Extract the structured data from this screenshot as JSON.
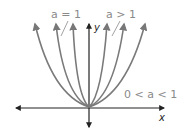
{
  "diagram": {
    "type": "parabola-family",
    "axes": {
      "x_label": "x",
      "y_label": "y"
    },
    "labels": {
      "a_equal_1": "a = 1",
      "a_greater_1": "a > 1",
      "a_between": "0 < a < 1"
    },
    "colors": {
      "curve": "#7a7a7a",
      "axis": "#222222",
      "label": "#8a8a8a"
    }
  }
}
